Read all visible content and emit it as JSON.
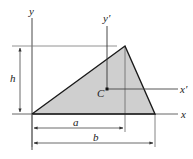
{
  "diagram": {
    "type": "triangle-centroid-geometry",
    "labels": {
      "y_axis": "y",
      "x_axis": "x",
      "y_prime_axis": "y′",
      "x_prime_axis": "x′",
      "centroid": "C",
      "height": "h",
      "dim_a": "a",
      "dim_b": "b"
    },
    "colors": {
      "fill": "#cfcfcf",
      "stroke": "#1a1a1a",
      "thin_line": "#444444",
      "background": "#ffffff"
    },
    "vertices": {
      "origin": [
        32,
        114
      ],
      "apex": [
        125,
        46
      ],
      "right": [
        155,
        114
      ]
    },
    "centroid_point": [
      107,
      89
    ]
  }
}
